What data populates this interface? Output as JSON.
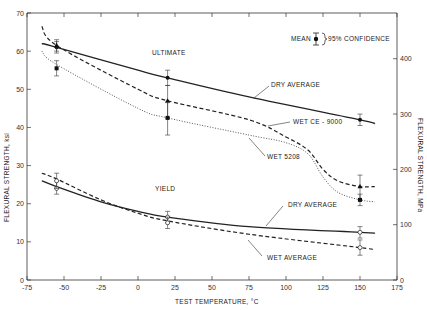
{
  "chart_data": {
    "type": "line",
    "title": "",
    "xlabel": "TEST TEMPERATURE, °C",
    "ylabel": "FLEXURAL STRENGTH, ksi",
    "ylabel_right": "FLEXURAL STRENGTH, MPa",
    "xlim": [
      -75,
      175
    ],
    "ylim": [
      0,
      70
    ],
    "ylim_right": [
      0,
      482
    ],
    "x_ticks": [
      -75,
      -50,
      -25,
      0,
      25,
      50,
      75,
      100,
      125,
      150,
      175
    ],
    "x_tick_labels": [
      "-75",
      "-50",
      "-25",
      "0",
      "25",
      "50",
      "75",
      "100",
      "125",
      "150",
      "175"
    ],
    "y_ticks": [
      0,
      10,
      20,
      30,
      40,
      50,
      60,
      70
    ],
    "y_right_ticks": [
      0,
      100,
      200,
      300,
      400
    ],
    "grid": false,
    "legend": {
      "position": "top-right",
      "text_mean": "MEAN",
      "text_conf": "95% CONFIDENCE"
    },
    "annotations": [
      "ULTIMATE",
      "YIELD",
      "DRY AVERAGE",
      "WET CE - 9000",
      "WET 5208",
      "DRY AVERAGE",
      "WET AVERAGE"
    ],
    "series": [
      {
        "name": "Ultimate - DRY AVERAGE",
        "style": "solid",
        "x": [
          -65,
          -55,
          0,
          20,
          75,
          150,
          160
        ],
        "y": [
          62,
          61,
          55,
          53,
          48,
          42,
          41
        ],
        "points": [
          {
            "x": -55,
            "y": 61,
            "err": [
              59.5,
              62.5
            ]
          },
          {
            "x": 20,
            "y": 53,
            "err": [
              51,
              55
            ]
          },
          {
            "x": 150,
            "y": 42,
            "err": [
              40.5,
              43.5
            ]
          }
        ]
      },
      {
        "name": "Ultimate - WET CE - 9000",
        "style": "dashed",
        "x": [
          -65,
          -55,
          0,
          20,
          75,
          100,
          115,
          125,
          135,
          150,
          160
        ],
        "y": [
          66.5,
          61.5,
          50,
          47,
          42,
          37.5,
          34,
          29,
          26,
          24.5,
          24.5
        ],
        "points": [
          {
            "x": -55,
            "y": 61.5,
            "err": [
              60,
              63
            ]
          },
          {
            "x": 20,
            "y": 47,
            "err": [
              42.5,
              51
            ]
          },
          {
            "x": 150,
            "y": 24.5,
            "err": [
              21,
              27.5
            ]
          }
        ]
      },
      {
        "name": "Ultimate - WET 5208",
        "style": "dotted",
        "x": [
          -65,
          -55,
          0,
          20,
          75,
          100,
          115,
          125,
          135,
          150,
          160
        ],
        "y": [
          60,
          56.5,
          45,
          42.5,
          38,
          36,
          33,
          27,
          23,
          21,
          20.5
        ],
        "points": [
          {
            "x": -55,
            "y": 55.5,
            "err": [
              53.5,
              57.5
            ]
          },
          {
            "x": 20,
            "y": 42.5,
            "err": [
              38,
              46.5
            ]
          },
          {
            "x": 150,
            "y": 21,
            "err": [
              19.5,
              22.5
            ]
          }
        ]
      },
      {
        "name": "Yield - DRY AVERAGE",
        "style": "solid",
        "x": [
          -65,
          -55,
          -25,
          0,
          20,
          75,
          150,
          160
        ],
        "y": [
          26,
          24.5,
          20.5,
          18,
          16.5,
          14,
          12.5,
          12.3
        ],
        "points": [
          {
            "x": -55,
            "y": 24,
            "err": [
              22.5,
              26
            ]
          },
          {
            "x": 20,
            "y": 16.5,
            "err": [
              15,
              18
            ]
          },
          {
            "x": 150,
            "y": 12.5,
            "err": [
              11,
              14
            ]
          }
        ]
      },
      {
        "name": "Yield - WET AVERAGE",
        "style": "dashed",
        "x": [
          -65,
          -55,
          -25,
          0,
          20,
          75,
          150,
          160
        ],
        "y": [
          28,
          26.5,
          21,
          17.5,
          15.5,
          12,
          8.5,
          7.8
        ],
        "points": [
          {
            "x": -55,
            "y": 26,
            "err": [
              24,
              28
            ]
          },
          {
            "x": 20,
            "y": 15,
            "err": [
              13.5,
              16.5
            ]
          },
          {
            "x": 150,
            "y": 8.5,
            "err": [
              6.5,
              10.5
            ]
          }
        ]
      }
    ]
  },
  "labels": {
    "ultimate": "ULTIMATE",
    "yield": "YIELD",
    "dry_avg_ult": "DRY AVERAGE",
    "wet_ce": "WET CE - 9000",
    "wet_5208": "WET 5208",
    "dry_avg_yield": "DRY AVERAGE",
    "wet_avg_yield": "WET AVERAGE",
    "legend_mean": "MEAN",
    "legend_conf": "95% CONFIDENCE",
    "xlabel": "TEST TEMPERATURE, °C",
    "ylabel_left": "FLEXURAL STRENGTH, ksi",
    "ylabel_right": "FLEXURAL STRENGTH, MPa"
  }
}
